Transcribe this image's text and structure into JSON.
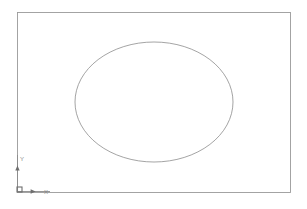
{
  "viewport": {
    "width": 307,
    "height": 209,
    "background_color": "#ffffff",
    "type": "cad-drawing-viewport"
  },
  "drawing": {
    "border_rectangle": {
      "label": "drawing-border",
      "x": 17,
      "y": 12,
      "width": 273,
      "height": 180,
      "stroke_color": "#9a9a9a",
      "stroke_width": 0.9,
      "fill": "none"
    },
    "ellipse": {
      "label": "ellipse-entity",
      "center_x": 154,
      "center_y": 102,
      "radius_x": 79,
      "radius_y": 60,
      "stroke_color": "#8d8d8d",
      "stroke_width": 0.8,
      "fill": "none"
    }
  },
  "ucs_icon": {
    "name": "ucs-coordinate-icon",
    "origin_x": 17,
    "origin_y": 191,
    "stroke_color": "#8a8a8a",
    "marker_color": "#6e6e6e",
    "y_axis": {
      "label": "Y",
      "label_x": 20,
      "label_y": 161,
      "arrow_x": 17,
      "arrow_y": 167,
      "axis_top_y": 155
    },
    "x_axis": {
      "label": "X",
      "label_x": 44,
      "label_y": 194,
      "arrow_x": 34,
      "arrow_y": 191,
      "axis_right_x": 50
    },
    "origin_marker": {
      "name": "origin-square-marker",
      "size": 5
    }
  }
}
